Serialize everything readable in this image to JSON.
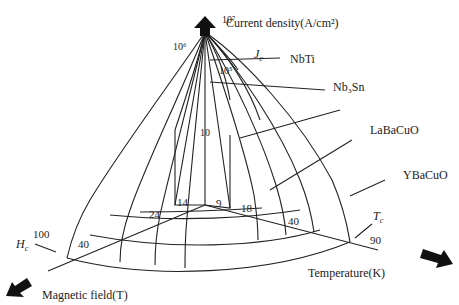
{
  "axes": {
    "current": {
      "label": "Current density(A/cm²)",
      "arrow": "up-arrow"
    },
    "field": {
      "label": "Magnetic field(T)",
      "arrow": "down-left-arrow"
    },
    "temperature": {
      "label": "Temperature(K)",
      "arrow": "right-arrow"
    }
  },
  "current_ticks": {
    "t7": "10⁷",
    "t6": "10⁶",
    "t5": "10⁵"
  },
  "field_ticks": {
    "t100": "100",
    "t40": "40",
    "t24": "24",
    "t14": "14"
  },
  "temp_ticks": {
    "t9": "9",
    "t18": "18",
    "t40": "40",
    "t90": "90"
  },
  "center_tick": "10",
  "annotations": {
    "jc": "J",
    "jc_sub": "c",
    "hc": "H",
    "hc_sub": "c",
    "tc": "T",
    "tc_sub": "c"
  },
  "materials": [
    "NbTi",
    "Nb₃Sn",
    "LaBaCuO",
    "YBaCuO"
  ],
  "colors": {
    "line": "#222222",
    "background": "#ffffff"
  }
}
